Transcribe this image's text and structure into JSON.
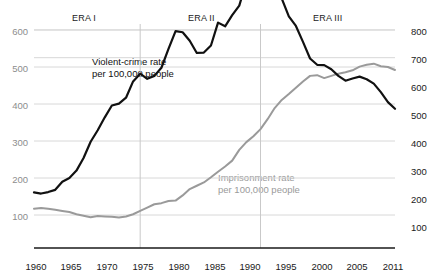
{
  "chart_data": {
    "type": "line",
    "title": "",
    "subtitle": "",
    "xlabel": "",
    "ylabel": "",
    "grid": true,
    "legend_position": "inline-annotation",
    "x": [
      1960,
      1961,
      1962,
      1963,
      1964,
      1965,
      1966,
      1967,
      1968,
      1969,
      1970,
      1971,
      1972,
      1973,
      1974,
      1975,
      1976,
      1977,
      1978,
      1979,
      1980,
      1981,
      1982,
      1983,
      1984,
      1985,
      1986,
      1987,
      1988,
      1989,
      1990,
      1991,
      1992,
      1993,
      1994,
      1995,
      1996,
      1997,
      1998,
      1999,
      2000,
      2001,
      2002,
      2003,
      2004,
      2005,
      2006,
      2007,
      2008,
      2009,
      2010,
      2011
    ],
    "axes": {
      "x": {
        "ticks": [
          1960,
          1965,
          1970,
          1975,
          1980,
          1985,
          1990,
          1995,
          2000,
          2005,
          2011
        ],
        "tick_labels": [
          "1960",
          "1965",
          "1970",
          "1975",
          "1980",
          "1985",
          "1990",
          "1995",
          "2000",
          "2005",
          "2011"
        ],
        "range": [
          1960,
          2011
        ]
      },
      "y_left": {
        "label": "",
        "ticks": [
          100,
          200,
          300,
          400,
          500,
          600
        ],
        "tick_labels": [
          "100",
          "200",
          "300",
          "400",
          "500",
          "600"
        ],
        "range": [
          0,
          640
        ]
      },
      "y_right": {
        "label": "",
        "ticks": [
          100,
          200,
          300,
          400,
          500,
          600,
          700,
          800
        ],
        "tick_labels": [
          "100",
          "200",
          "300",
          "400",
          "500",
          "600",
          "700",
          "800"
        ],
        "range": [
          0,
          853
        ]
      }
    },
    "series": [
      {
        "name": "Violent-crime rate per 100,000 people",
        "axis": "left",
        "color": "#111111",
        "label_line1": "Violent-crime rate",
        "label_line2": "per 100,000 people",
        "values": [
          161,
          158,
          162,
          168,
          190,
          200,
          220,
          254,
          298,
          329,
          364,
          396,
          401,
          417,
          461,
          482,
          468,
          476,
          498,
          549,
          597,
          594,
          571,
          538,
          539,
          558,
          620,
          610,
          640,
          666,
          730,
          758,
          758,
          747,
          714,
          685,
          637,
          611,
          568,
          523,
          506,
          505,
          494,
          476,
          463,
          469,
          474,
          467,
          455,
          432,
          405,
          387
        ]
      },
      {
        "name": "Imprisonment rate per 100,000 people",
        "axis": "left",
        "color": "#9a9a9a",
        "label_line1": "Imprisonment rate",
        "label_line2": "per 100,000 people",
        "values": [
          117,
          119,
          117,
          114,
          111,
          108,
          102,
          98,
          94,
          97,
          96,
          95,
          93,
          96,
          102,
          111,
          120,
          129,
          132,
          138,
          139,
          153,
          170,
          179,
          188,
          202,
          217,
          231,
          247,
          276,
          297,
          313,
          332,
          359,
          389,
          411,
          427,
          444,
          461,
          476,
          478,
          470,
          476,
          482,
          486,
          491,
          501,
          506,
          509,
          502,
          500,
          492
        ]
      }
    ],
    "annotations": [
      {
        "name": "era-1",
        "text": "ERA I",
        "x": 1973
      },
      {
        "name": "era-2",
        "text": "ERA II",
        "x": 1987
      },
      {
        "name": "era-3",
        "text": "ERA III",
        "x": 2001
      }
    ],
    "dividers": [
      1975,
      1992
    ]
  },
  "colors": {
    "crime_line": "#111111",
    "prison_line": "#9a9a9a",
    "grid": "#d8d8d8",
    "axis": "#1a1a1a",
    "left_tick_text": "#8d8d8d",
    "right_tick_text": "#222222",
    "background": "#ffffff"
  }
}
